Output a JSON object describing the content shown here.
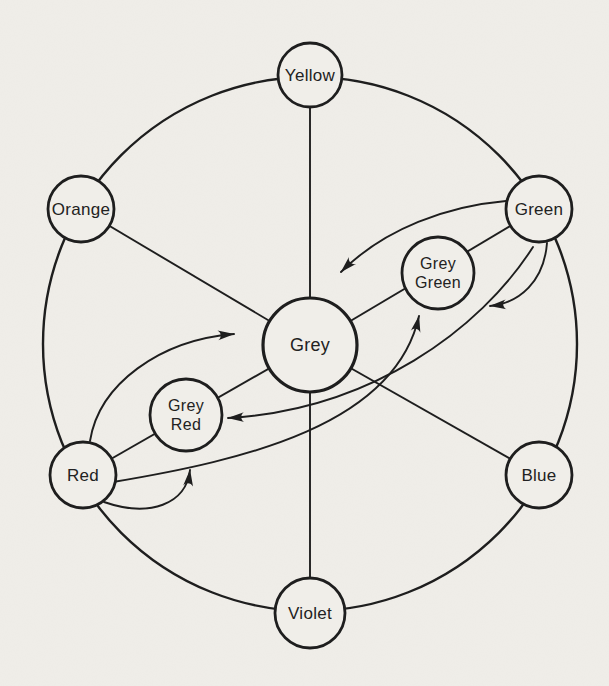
{
  "figure": {
    "background_color": "#f0eee9",
    "line_color": "#1e1e1e",
    "text_color": "#222222",
    "canvas": {
      "width": 609,
      "height": 686
    },
    "outer_circle": {
      "cx": 310,
      "cy": 344,
      "r": 267
    },
    "nodes": [
      {
        "id": "yellow",
        "label_lines": [
          "Yellow"
        ],
        "x": 310,
        "y": 75,
        "r": 32,
        "stroke": 2.8,
        "font": 17
      },
      {
        "id": "orange",
        "label_lines": [
          "Orange"
        ],
        "x": 81,
        "y": 209,
        "r": 33,
        "stroke": 2.8,
        "font": 17
      },
      {
        "id": "green",
        "label_lines": [
          "Green"
        ],
        "x": 539,
        "y": 209,
        "r": 33,
        "stroke": 2.8,
        "font": 17
      },
      {
        "id": "red",
        "label_lines": [
          "Red"
        ],
        "x": 83,
        "y": 475,
        "r": 33,
        "stroke": 2.8,
        "font": 17
      },
      {
        "id": "blue",
        "label_lines": [
          "Blue"
        ],
        "x": 539,
        "y": 475,
        "r": 33,
        "stroke": 2.8,
        "font": 17
      },
      {
        "id": "violet",
        "label_lines": [
          "Violet"
        ],
        "x": 310,
        "y": 613,
        "r": 35,
        "stroke": 2.8,
        "font": 17
      },
      {
        "id": "grey",
        "label_lines": [
          "Grey"
        ],
        "x": 310,
        "y": 345,
        "r": 47,
        "stroke": 3.2,
        "font": 18
      },
      {
        "id": "grey-green",
        "label_lines": [
          "Grey",
          "Green"
        ],
        "x": 438,
        "y": 273,
        "r": 36,
        "stroke": 2.8,
        "font": 16
      },
      {
        "id": "grey-red",
        "label_lines": [
          "Grey",
          "Red"
        ],
        "x": 186,
        "y": 415,
        "r": 36,
        "stroke": 2.8,
        "font": 16
      }
    ],
    "spokes": [
      {
        "id": "spoke-yellow-grey",
        "from": "yellow",
        "to": "grey"
      },
      {
        "id": "spoke-violet-grey",
        "from": "violet",
        "to": "grey"
      },
      {
        "id": "spoke-orange-grey",
        "from": "orange",
        "to": "grey"
      },
      {
        "id": "spoke-blue-grey",
        "from": "blue",
        "to": "grey"
      },
      {
        "id": "spoke-red-grey",
        "from": "red",
        "to": "grey"
      },
      {
        "id": "spoke-green-grey",
        "from": "green",
        "to": "grey"
      }
    ],
    "arrows": [
      {
        "id": "arrow-green-to-grey",
        "path": "M 506,201 C 448,206 385,228 341,272"
      },
      {
        "id": "arrow-green-to-grey-red",
        "path": "M 533,247 C 480,330 370,410 228,418"
      },
      {
        "id": "arrow-green-loop",
        "path": "M 547,243 C 544,281 520,303 490,306"
      },
      {
        "id": "arrow-red-to-grey",
        "path": "M 90,441 C 99,384 160,340 234,334"
      },
      {
        "id": "arrow-red-to-grey-green",
        "path": "M 113,482 C 245,460 395,425 419,316"
      },
      {
        "id": "arrow-red-loop",
        "path": "M 104,502 C 150,518 186,504 190,470"
      }
    ]
  }
}
